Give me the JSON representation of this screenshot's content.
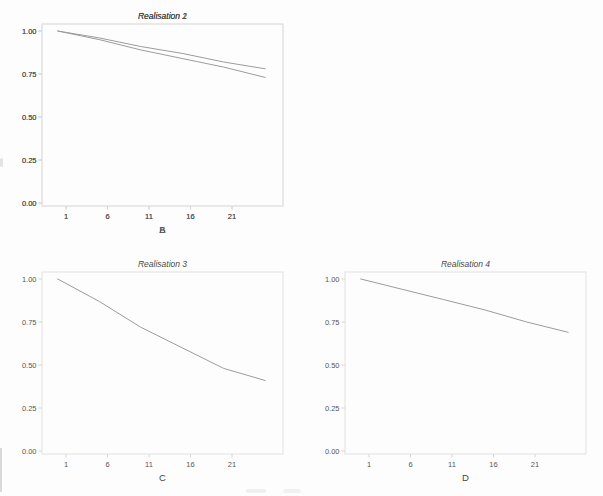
{
  "figure": {
    "background": "#fdfdfd",
    "frame_color": "#e1e1e1",
    "tick_color": "#d6d6d6",
    "line_color": "#9c9c9c",
    "title_color": "#4a4a4a",
    "label_color": "#575757",
    "axis_letter_color": "#454545"
  },
  "chart_data": [
    {
      "type": "line",
      "title": "Realisation 1",
      "xlabel": "A",
      "x": [
        0,
        5,
        10,
        15,
        20,
        25
      ],
      "values": [
        1.0,
        0.96,
        0.91,
        0.87,
        0.82,
        0.78
      ],
      "x_ticks": [
        1,
        6,
        11,
        16,
        21
      ],
      "x_tick_labels": [
        "1",
        "6",
        "11",
        "16",
        "21"
      ],
      "y_tick_values": [
        0,
        0.25,
        0.5,
        0.75,
        1
      ],
      "y_tick_labels": [
        "0.00",
        "0.25",
        "0.50",
        "0.75",
        "1.00"
      ],
      "ylim": [
        0,
        1
      ],
      "xlim": [
        -2,
        27
      ],
      "grid": false,
      "legend": "none"
    },
    {
      "type": "line",
      "title": "Realisation 2",
      "xlabel": "B",
      "x": [
        0,
        5,
        10,
        15,
        20,
        25
      ],
      "values": [
        1.0,
        0.95,
        0.89,
        0.84,
        0.79,
        0.73
      ],
      "x_ticks": [
        1,
        6,
        11,
        16,
        21
      ],
      "x_tick_labels": [
        "1",
        "6",
        "11",
        "16",
        "21"
      ],
      "y_tick_values": [
        0,
        0.25,
        0.5,
        0.75,
        1
      ],
      "y_tick_labels": [
        "0.00",
        "0.25",
        "0.50",
        "0.75",
        "1.00"
      ],
      "ylim": [
        0,
        1
      ],
      "xlim": [
        -2,
        27
      ],
      "grid": false,
      "legend": "none"
    },
    {
      "type": "line",
      "title": "Realisation 3",
      "xlabel": "C",
      "x": [
        0,
        5,
        10,
        15,
        20,
        25
      ],
      "values": [
        1.0,
        0.87,
        0.72,
        0.6,
        0.48,
        0.41
      ],
      "x_ticks": [
        1,
        6,
        11,
        16,
        21
      ],
      "x_tick_labels": [
        "1",
        "6",
        "11",
        "16",
        "21"
      ],
      "y_tick_values": [
        0,
        0.25,
        0.5,
        0.75,
        1
      ],
      "y_tick_labels": [
        "0.00",
        "0.25",
        "0.50",
        "0.75",
        "1.00"
      ],
      "ylim": [
        0,
        1
      ],
      "xlim": [
        -2,
        27
      ],
      "grid": false,
      "legend": "none"
    },
    {
      "type": "line",
      "title": "Realisation 4",
      "xlabel": "D",
      "x": [
        0,
        5,
        10,
        15,
        20,
        25
      ],
      "values": [
        1.0,
        0.94,
        0.88,
        0.82,
        0.75,
        0.69
      ],
      "x_ticks": [
        1,
        6,
        11,
        16,
        21
      ],
      "x_tick_labels": [
        "1",
        "6",
        "11",
        "16",
        "21"
      ],
      "y_tick_values": [
        0,
        0.25,
        0.5,
        0.75,
        1
      ],
      "y_tick_labels": [
        "0.00",
        "0.25",
        "0.50",
        "0.75",
        "1.00"
      ],
      "ylim": [
        0,
        1
      ],
      "xlim": [
        -2,
        27
      ],
      "grid": false,
      "legend": "none"
    }
  ]
}
